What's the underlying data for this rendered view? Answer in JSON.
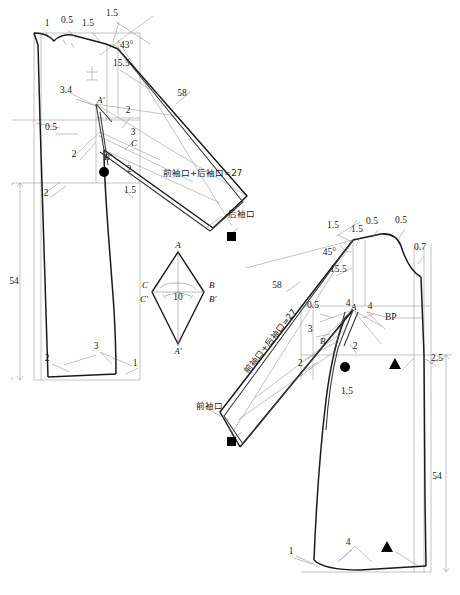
{
  "document": {
    "type": "garment-pattern-draft",
    "title": "Kimono sleeve bodice block - front and back pattern pieces"
  },
  "colors": {
    "outline_heavy": "#1a1a1a",
    "outline_light": "#8a8a8a",
    "construction": "#9a9a9a",
    "marker_fill": "#000000",
    "background": "#ffffff"
  },
  "back_piece": {
    "name": "back-bodice-with-kimono-sleeve",
    "measurements": [
      {
        "id": "bk-neck-1",
        "value": "1",
        "x": 47,
        "y": 26
      },
      {
        "id": "bk-neck-05",
        "value": "0.5",
        "x": 67,
        "y": 23
      },
      {
        "id": "bk-shoulder-15",
        "value": "1.5",
        "x": 88,
        "y": 26
      },
      {
        "id": "bk-top-15",
        "value": "1.5",
        "x": 112,
        "y": 16
      },
      {
        "id": "bk-angle-43",
        "value": "43°",
        "x": 120,
        "y": 48
      },
      {
        "id": "bk-sleevecap-155",
        "value": "15.5",
        "x": 113,
        "y": 66
      },
      {
        "id": "bk-sleeve-58",
        "value": "58",
        "x": 182,
        "y": 96
      },
      {
        "id": "bk-dart-34",
        "value": "3.4",
        "x": 66,
        "y": 93
      },
      {
        "id": "bk-underarm-2a",
        "value": "2",
        "x": 128,
        "y": 113
      },
      {
        "id": "bk-underarm-3",
        "value": "3",
        "x": 133,
        "y": 135
      },
      {
        "id": "bk-side-2a",
        "value": "2",
        "x": 74,
        "y": 157
      },
      {
        "id": "bk-side-2b",
        "value": "2",
        "x": 129,
        "y": 172
      },
      {
        "id": "bk-hem-15",
        "value": "1.5",
        "x": 130,
        "y": 193
      },
      {
        "id": "bk-waist-05",
        "value": "0.5",
        "x": 51,
        "y": 130
      },
      {
        "id": "bk-hip-2",
        "value": "2",
        "x": 46,
        "y": 196
      },
      {
        "id": "bk-length-54",
        "value": "54",
        "x": 14,
        "y": 284
      },
      {
        "id": "bk-hem-2",
        "value": "2",
        "x": 47,
        "y": 361
      },
      {
        "id": "bk-hem-3",
        "value": "3",
        "x": 96,
        "y": 349
      },
      {
        "id": "bk-hem-1",
        "value": "1",
        "x": 135,
        "y": 366
      }
    ],
    "point_labels": [
      {
        "id": "bk-point-A-prime",
        "value": "A′",
        "x": 97,
        "y": 103
      },
      {
        "id": "bk-point-B-prime",
        "value": "B′",
        "x": 104,
        "y": 160
      },
      {
        "id": "bk-point-C",
        "value": "C",
        "x": 131,
        "y": 146
      }
    ],
    "annotations": [
      {
        "id": "bk-cuff-sum",
        "value": "前袖口+后袖口=27",
        "x": 163,
        "y": 176
      },
      {
        "id": "bk-back-cuff",
        "value": "后袖口",
        "x": 228,
        "y": 217
      }
    ],
    "markers": [
      {
        "id": "bk-dot-marker",
        "shape": "circle",
        "x": 104,
        "y": 172
      },
      {
        "id": "bk-square-marker",
        "shape": "square",
        "x": 231,
        "y": 236
      }
    ]
  },
  "sleeve_gusset": {
    "name": "sleeve-gusset-diamond",
    "width_label": {
      "id": "gusset-width-10",
      "value": "10",
      "x": 178,
      "y": 300
    },
    "point_labels": [
      {
        "id": "gusset-point-A",
        "value": "A",
        "x": 178,
        "y": 248
      },
      {
        "id": "gusset-point-A-prime",
        "value": "A′",
        "x": 178,
        "y": 350
      },
      {
        "id": "gusset-point-B",
        "value": "B",
        "x": 209,
        "y": 285
      },
      {
        "id": "gusset-point-B-prime",
        "value": "B′",
        "x": 209,
        "y": 300
      },
      {
        "id": "gusset-point-C",
        "value": "C",
        "x": 143,
        "y": 286
      },
      {
        "id": "gusset-point-C-prime",
        "value": "C′",
        "x": 143,
        "y": 300
      }
    ]
  },
  "front_piece": {
    "name": "front-bodice-with-kimono-sleeve",
    "measurements": [
      {
        "id": "ft-top-15a",
        "value": "1.5",
        "x": 333,
        "y": 228
      },
      {
        "id": "ft-top-15b",
        "value": "1.5",
        "x": 357,
        "y": 232
      },
      {
        "id": "ft-neck-05a",
        "value": "0.5",
        "x": 372,
        "y": 224
      },
      {
        "id": "ft-neck-05b",
        "value": "0.5",
        "x": 401,
        "y": 223
      },
      {
        "id": "ft-cf-07",
        "value": "0.7",
        "x": 420,
        "y": 250
      },
      {
        "id": "ft-angle-45",
        "value": "45°",
        "x": 325,
        "y": 255
      },
      {
        "id": "ft-sleevecap-155",
        "value": "15.5",
        "x": 330,
        "y": 272
      },
      {
        "id": "ft-sleeve-58",
        "value": "58",
        "x": 277,
        "y": 288
      },
      {
        "id": "ft-dart-05",
        "value": "0.5",
        "x": 313,
        "y": 308
      },
      {
        "id": "ft-bust-4a",
        "value": "4",
        "x": 348,
        "y": 306
      },
      {
        "id": "ft-bust-4b",
        "value": "4",
        "x": 370,
        "y": 309
      },
      {
        "id": "ft-dart-3",
        "value": "3",
        "x": 310,
        "y": 332
      },
      {
        "id": "ft-dart-2a",
        "value": "2",
        "x": 355,
        "y": 349
      },
      {
        "id": "ft-side-2b",
        "value": "2",
        "x": 300,
        "y": 366
      },
      {
        "id": "ft-hem-15",
        "value": "1.5",
        "x": 347,
        "y": 394
      },
      {
        "id": "ft-waist-25",
        "value": "2.5",
        "x": 437,
        "y": 361
      },
      {
        "id": "ft-length-54",
        "value": "54",
        "x": 437,
        "y": 479
      },
      {
        "id": "ft-hem-4",
        "value": "4",
        "x": 348,
        "y": 545
      },
      {
        "id": "ft-hem-1",
        "value": "1",
        "x": 291,
        "y": 554
      }
    ],
    "point_labels": [
      {
        "id": "ft-point-A",
        "value": "A",
        "x": 351,
        "y": 310
      },
      {
        "id": "ft-point-B",
        "value": "B",
        "x": 323,
        "y": 341
      },
      {
        "id": "ft-bp",
        "value": "BP",
        "x": 385,
        "y": 317
      }
    ],
    "annotations": [
      {
        "id": "ft-cuff-sum",
        "value": "前袖口+后袖口=27",
        "x": 248,
        "y": 374
      },
      {
        "id": "ft-front-cuff",
        "value": "前袖口",
        "x": 196,
        "y": 409
      }
    ],
    "markers": [
      {
        "id": "ft-dot-marker",
        "shape": "circle",
        "x": 345,
        "y": 367
      },
      {
        "id": "ft-square-marker",
        "shape": "square",
        "x": 231,
        "y": 441
      },
      {
        "id": "ft-triangle-waist",
        "shape": "triangle",
        "x": 395,
        "y": 364
      },
      {
        "id": "ft-triangle-hem",
        "shape": "triangle",
        "x": 387,
        "y": 547
      }
    ]
  }
}
